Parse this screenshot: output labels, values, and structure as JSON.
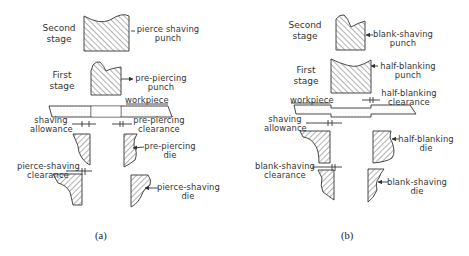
{
  "figure": {
    "panels": [
      {
        "id": "a",
        "caption": "(a)",
        "stages": {
          "second": [
            "Second",
            "stage"
          ],
          "first": [
            "First",
            "stage"
          ]
        },
        "labels": {
          "second_punch": [
            "pierce shaving",
            "punch"
          ],
          "first_punch": [
            "pre-piercing",
            "punch"
          ],
          "workpiece": "workpiece",
          "shaving_allowance": [
            "shaving",
            "allowance"
          ],
          "first_clearance": [
            "pre-piercing",
            "clearance"
          ],
          "first_die": [
            "pre-piercing",
            "die"
          ],
          "second_clearance": [
            "pierce-shaving",
            "clearance"
          ],
          "second_die": [
            "pierce-shaving",
            "die"
          ]
        }
      },
      {
        "id": "b",
        "caption": "(b)",
        "stages": {
          "second": [
            "Second",
            "stage"
          ],
          "first": [
            "First",
            "stage"
          ]
        },
        "labels": {
          "second_punch": [
            "blank-shaving",
            "punch"
          ],
          "first_punch": [
            "half-blanking",
            "punch"
          ],
          "workpiece": "workpiece",
          "first_clearance": [
            "half-blanking",
            "clearance"
          ],
          "shaving_allowance": [
            "shaving",
            "allowance"
          ],
          "first_die": [
            "half-blanking",
            "die"
          ],
          "second_clearance": [
            "blank-shaving",
            "clearance"
          ],
          "second_die": [
            "blank-shaving",
            "die"
          ]
        }
      }
    ],
    "colors": {
      "line": "#333333",
      "hatch": "#555555",
      "background": "#ffffff"
    }
  }
}
